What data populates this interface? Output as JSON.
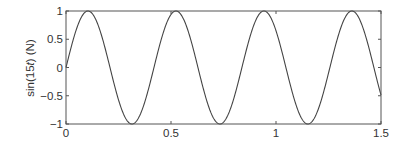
{
  "chart_data": {
    "type": "line",
    "title": "",
    "xlabel": "",
    "ylabel": "sin(15t) (N)",
    "ylabel_parts": {
      "prefix": "sin(15",
      "var": "t",
      "suffix": ") (N)"
    },
    "function": "sin(15*t)",
    "xlim": [
      0,
      1.5
    ],
    "ylim": [
      -1,
      1
    ],
    "x_ticks": [
      0,
      0.5,
      1,
      1.5
    ],
    "x_tick_labels": [
      "0",
      "0.5",
      "1",
      "1.5"
    ],
    "y_ticks": [
      -1,
      -0.5,
      0,
      0.5,
      1
    ],
    "y_tick_labels": [
      "−1",
      "−0.5",
      "0",
      "0.5",
      "1"
    ],
    "grid": false,
    "legend": null,
    "series": [
      {
        "name": "sin(15t)",
        "color": "#444444",
        "x": [
          0,
          0.1,
          0.2,
          0.3,
          0.4,
          0.5,
          0.6,
          0.7,
          0.8,
          0.9,
          1.0,
          1.1,
          1.2,
          1.3,
          1.4,
          1.5
        ],
        "values": [
          0,
          0.997,
          0.141,
          -0.978,
          -0.279,
          0.938,
          0.412,
          -0.88,
          -0.537,
          0.804,
          0.65,
          -0.712,
          -0.751,
          0.606,
          0.837,
          -0.488
        ]
      }
    ]
  },
  "style": {
    "line_color": "#444444",
    "axis_color": "#555555",
    "text_color": "#333333"
  }
}
